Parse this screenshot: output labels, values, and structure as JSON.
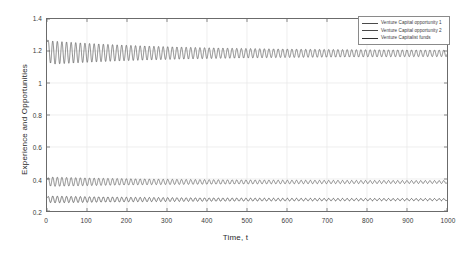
{
  "chart_data": {
    "type": "line",
    "title": "",
    "xlabel": "Time, t",
    "ylabel": "Experience and Opportunities",
    "xlim": [
      0,
      1000
    ],
    "ylim": [
      0.2,
      1.4
    ],
    "xticks": [
      0,
      100,
      200,
      300,
      400,
      500,
      600,
      700,
      800,
      900,
      1000
    ],
    "xtick_labels": [
      "0",
      "100",
      "200",
      "300",
      "400",
      "500",
      "600",
      "700",
      "800",
      "900",
      "1000"
    ],
    "yticks": [
      0.2,
      0.4,
      0.6,
      0.8,
      1.0,
      1.2,
      1.4
    ],
    "ytick_labels": [
      "0.2",
      "0.4",
      "0.6",
      "0.8",
      "1",
      "1.2",
      "1.4"
    ],
    "grid": true,
    "legend_position": "upper right",
    "series": [
      {
        "name": "Venture Capital opportunity 1",
        "color": "#4a4a4a",
        "description": "Damped oscillation: initial spike to 1.27 at t=0, oscillating about a mean of 1.185, amplitude decaying from 0.075 to 0.018",
        "mean_start": 1.19,
        "mean_end": 1.185,
        "amplitude_start": 0.075,
        "amplitude_end": 0.018,
        "period": 11.5,
        "initial_spike": 1.27
      },
      {
        "name": "Venture Capital opportunity 2",
        "color": "#4a4a4a",
        "description": "Damped oscillation about a mean of 0.382, amplitude decaying from 0.030 to 0.008",
        "mean_start": 0.383,
        "mean_end": 0.381,
        "amplitude_start": 0.03,
        "amplitude_end": 0.008,
        "period": 11.5,
        "initial_spike": 0.4
      },
      {
        "name": "Venture Capitalist funds",
        "color": "#303030",
        "description": "Damped oscillation about a mean of 0.272, amplitude decaying from 0.022 to 0.006",
        "mean_start": 0.272,
        "mean_end": 0.271,
        "amplitude_start": 0.022,
        "amplitude_end": 0.006,
        "period": 11.5,
        "initial_spike": 0.285
      }
    ]
  },
  "legend": {
    "entries": [
      {
        "label": "Venture Capital opportunity 1"
      },
      {
        "label": "Venture Capital opportunity 2"
      },
      {
        "label": "Venture Capitalist funds"
      }
    ]
  },
  "axes": {
    "x_title": "Time, t",
    "y_title": "Experience and Opportunities"
  }
}
